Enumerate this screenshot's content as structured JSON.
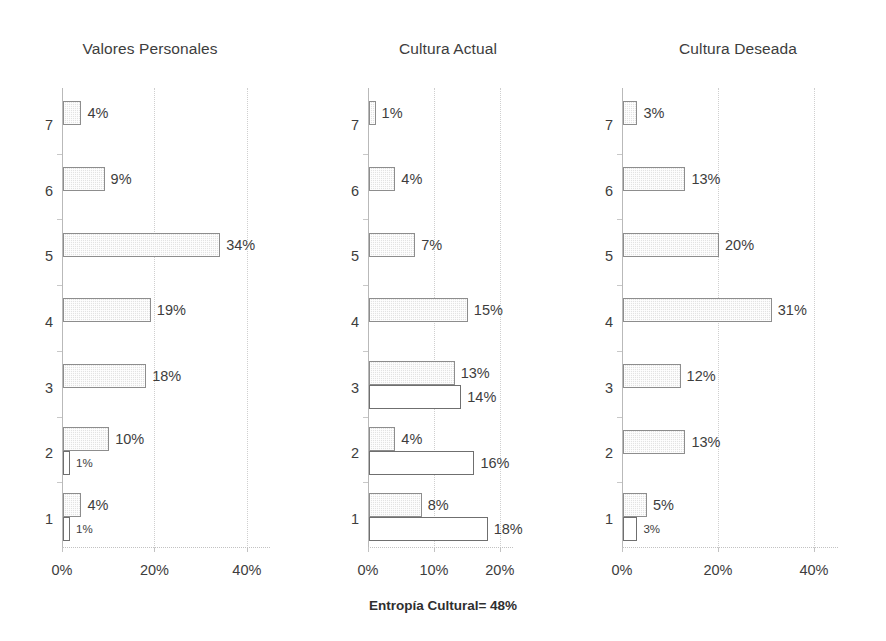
{
  "figure": {
    "footnote": "Entropía Cultural= 48%",
    "background_color": "#ffffff",
    "bar_fill_color": "#e3e3e3",
    "bar_border_color": "#8d8d8d",
    "hollow_bar_color": "#ffffff",
    "axis_color": "#b9b9b9",
    "text_color": "#3d3d3d"
  },
  "chart_data": [
    {
      "type": "bar",
      "orientation": "horizontal",
      "title": "Valores Personales",
      "xlabel": "",
      "ylabel": "",
      "categories": [
        "7",
        "6",
        "5",
        "4",
        "3",
        "2",
        "1"
      ],
      "xlim": [
        0,
        45
      ],
      "xticks": [
        0,
        20,
        40
      ],
      "xtick_labels": [
        "0%",
        "20%",
        "40%"
      ],
      "grid": true,
      "legend": "none",
      "series": [
        {
          "name": "positivos",
          "style": "filled",
          "values": [
            4,
            9,
            34,
            19,
            18,
            10,
            4
          ],
          "labels": [
            "4%",
            "9%",
            "34%",
            "19%",
            "18%",
            "10%",
            "4%"
          ]
        },
        {
          "name": "potencialmente limitantes",
          "style": "hollow",
          "values": [
            null,
            null,
            null,
            null,
            null,
            1,
            1
          ],
          "labels": [
            null,
            null,
            null,
            null,
            null,
            "1%",
            "1%"
          ]
        }
      ]
    },
    {
      "type": "bar",
      "orientation": "horizontal",
      "title": "Cultura Actual",
      "xlabel": "",
      "ylabel": "",
      "categories": [
        "7",
        "6",
        "5",
        "4",
        "3",
        "2",
        "1"
      ],
      "xlim": [
        0,
        22
      ],
      "xticks": [
        0,
        10,
        20
      ],
      "xtick_labels": [
        "0%",
        "10%",
        "20%"
      ],
      "grid": true,
      "legend": "none",
      "series": [
        {
          "name": "positivos",
          "style": "filled",
          "values": [
            1,
            4,
            7,
            15,
            13,
            4,
            8
          ],
          "labels": [
            "1%",
            "4%",
            "7%",
            "15%",
            "13%",
            "4%",
            "8%"
          ]
        },
        {
          "name": "potencialmente limitantes",
          "style": "hollow",
          "values": [
            null,
            null,
            null,
            null,
            14,
            16,
            18
          ],
          "labels": [
            null,
            null,
            null,
            null,
            "14%",
            "16%",
            "18%"
          ]
        }
      ]
    },
    {
      "type": "bar",
      "orientation": "horizontal",
      "title": "Cultura Deseada",
      "xlabel": "",
      "ylabel": "",
      "categories": [
        "7",
        "6",
        "5",
        "4",
        "3",
        "2",
        "1"
      ],
      "xlim": [
        0,
        45
      ],
      "xticks": [
        0,
        20,
        40
      ],
      "xtick_labels": [
        "0%",
        "20%",
        "40%"
      ],
      "grid": true,
      "legend": "none",
      "series": [
        {
          "name": "positivos",
          "style": "filled",
          "values": [
            3,
            13,
            20,
            31,
            12,
            13,
            5
          ],
          "labels": [
            "3%",
            "13%",
            "20%",
            "31%",
            "12%",
            "13%",
            "5%"
          ]
        },
        {
          "name": "potencialmente limitantes",
          "style": "hollow",
          "values": [
            null,
            null,
            null,
            null,
            null,
            null,
            3
          ],
          "labels": [
            null,
            null,
            null,
            null,
            null,
            null,
            "3%"
          ]
        }
      ]
    }
  ],
  "layout": {
    "panels": [
      {
        "left": 0,
        "width": 300,
        "plot_left": 62,
        "plot_top": 88,
        "plot_width": 208,
        "plot_height": 460
      },
      {
        "left": 300,
        "width": 296,
        "plot_left": 68,
        "plot_top": 88,
        "plot_width": 145,
        "plot_height": 460
      },
      {
        "left": 590,
        "width": 296,
        "plot_left": 32,
        "plot_top": 88,
        "plot_width": 216,
        "plot_height": 460
      }
    ],
    "footnote_top": 598
  }
}
